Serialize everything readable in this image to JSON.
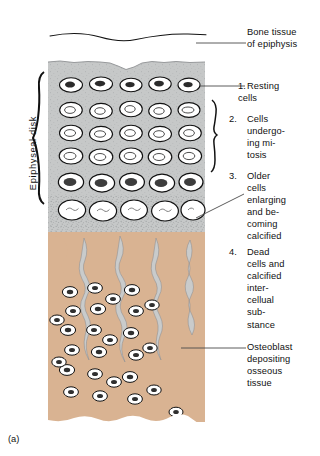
{
  "figure": {
    "caption": "(a)",
    "left_label": "Epiphyseal disk"
  },
  "labels": [
    {
      "id": "bone-tissue",
      "number": "",
      "text": "Bone tissue\nof epiphysis"
    },
    {
      "id": "resting",
      "number": "1.",
      "text": "Resting\ncells"
    },
    {
      "id": "mitosis",
      "number": "2.",
      "text": "Cells\nundergo-\ning mi-\ntosis"
    },
    {
      "id": "older-cells",
      "number": "3.",
      "text": "Older\ncells\nenlarging\nand be-\ncoming\ncalcified"
    },
    {
      "id": "dead-cells",
      "number": "4.",
      "text": "Dead\ncells and\ncalcified\ninter-\ncellual\nsub-\nstance"
    },
    {
      "id": "osteoblast",
      "number": "",
      "text": "Osteoblast\ndepositing\nosseous\ntissue"
    }
  ],
  "colors": {
    "cartilage_matrix": "#c6c8c8",
    "bone_matrix": "#d9b392",
    "lacuna": "#ffffff",
    "spicule": "#c9cbcb",
    "outline": "#111111",
    "leader": "#4a4a4a",
    "background": "#ffffff"
  },
  "regions": [
    {
      "name": "cartilage-zone",
      "fill": "#c6c8c8",
      "rows": 6
    },
    {
      "name": "ossification-zone",
      "fill": "#d9b392",
      "columns": 4
    }
  ]
}
